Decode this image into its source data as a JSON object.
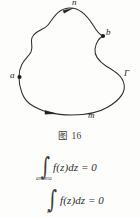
{
  "figure": {
    "name": "closed-contour-diagram",
    "caption": "图 16",
    "contour_name": "Γ",
    "points": [
      {
        "id": "a",
        "label": "a",
        "x": 19,
        "y": 77,
        "marker": "dot"
      },
      {
        "id": "b",
        "label": "b",
        "x": 103,
        "y": 36,
        "marker": "dot"
      },
      {
        "id": "n",
        "label": "n",
        "x": 69,
        "y": 9,
        "marker": "arrow"
      },
      {
        "id": "m",
        "label": "m",
        "x": 83,
        "y": 112,
        "marker": "arrow"
      }
    ],
    "labels": {
      "n": "n",
      "b": "b",
      "a": "a",
      "gamma": "Γ",
      "m": "m"
    },
    "stroke_color": "#2e2e2e",
    "background_color": "#fdfdfc"
  },
  "formulas": [
    {
      "id": "integral-ambna",
      "integral_symbol": "∫",
      "subscript": "ambna",
      "integrand": "f(z)",
      "differential": "dz",
      "relation": "= 0",
      "body": "f(z)dz = 0"
    },
    {
      "id": "integral-gamma",
      "integral_symbol": "∫",
      "subscript": "Γ",
      "integrand": "f(z)",
      "differential": "dz",
      "relation": "= 0",
      "body": "f(z)dz = 0"
    }
  ]
}
